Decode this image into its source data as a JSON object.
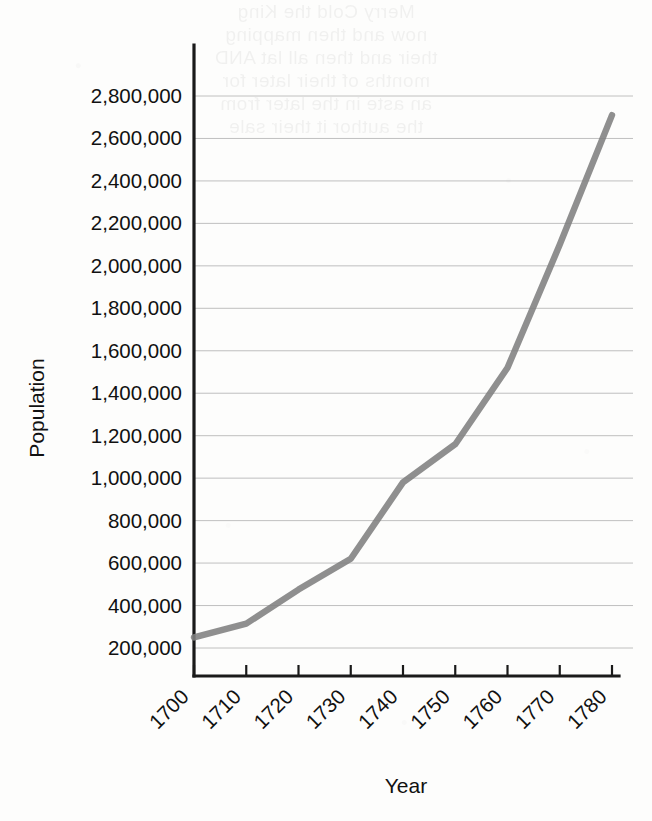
{
  "page": {
    "background_color": "#fdfdfc",
    "bleed_through_text": "Merry Cold the King\nnow and then mapping\ntheir and then all lat AND\nmonths of their later for\nan aste in the later from\nthe author it their sale"
  },
  "chart_data": {
    "type": "line",
    "title": "",
    "xlabel": "Year",
    "ylabel": "Population",
    "x": [
      1700,
      1710,
      1720,
      1730,
      1740,
      1750,
      1760,
      1770,
      1780
    ],
    "values": [
      250000,
      315000,
      475000,
      620000,
      980000,
      1160000,
      1520000,
      2100000,
      2710000
    ],
    "series": [
      {
        "name": "Population",
        "values": [
          250000,
          315000,
          475000,
          620000,
          980000,
          1160000,
          1520000,
          2100000,
          2710000
        ]
      }
    ],
    "xtick_labels": [
      "1700",
      "1710",
      "1720",
      "1730",
      "1740",
      "1750",
      "1760",
      "1770",
      "1780"
    ],
    "ytick_labels": [
      "200,000",
      "400,000",
      "600,000",
      "800,000",
      "1,000,000",
      "1,200,000",
      "1,400,000",
      "1,600,000",
      "1,800,000",
      "2,000,000",
      "2,200,000",
      "2,400,000",
      "2,600,000",
      "2,800,000"
    ],
    "ytick_values": [
      200000,
      400000,
      600000,
      800000,
      1000000,
      1200000,
      1400000,
      1600000,
      1800000,
      2000000,
      2200000,
      2400000,
      2600000,
      2800000
    ],
    "xlim": [
      1700,
      1780
    ],
    "ylim": [
      200000,
      2800000
    ],
    "grid": true,
    "grid_axis": "y",
    "legend": false,
    "legend_position": "none",
    "xtick_label_rotation": 45,
    "ylabel_rotation": 90,
    "line_color": "#808080",
    "axis_color": "#1a1a1a",
    "gridline_color": "#b9b9b9",
    "line_width_px": 6.4
  }
}
